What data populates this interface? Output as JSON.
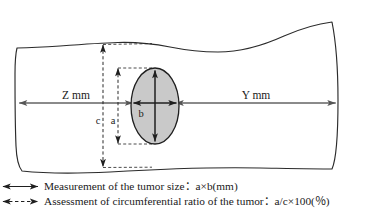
{
  "figure": {
    "type": "anatomical-measurement-diagram",
    "colors": {
      "outline": "#2b2b2b",
      "tumor_fill": "#c9c9c9",
      "tumor_border": "#1f1f1f",
      "solid_arrow": "#555555",
      "dashed_arrow": "#1f1f1f",
      "text": "#1a1a1a",
      "background": "#ffffff"
    }
  },
  "diagram": {
    "labels": {
      "proximal_margin": "Z mm",
      "distal_margin": "Y mm",
      "tumor_width": "b",
      "tumor_height": "a",
      "circumference": "c"
    }
  },
  "legend": {
    "items": [
      {
        "marker": "solid-double-arrow-icon",
        "separator": ":",
        "text": "Measurement of the tumor size：a×b(mm)"
      },
      {
        "marker": "dashed-double-arrow-icon",
        "separator": ":",
        "text": "Assessment of circumferential ratio of the tumor：a/c×100(％)"
      }
    ]
  }
}
